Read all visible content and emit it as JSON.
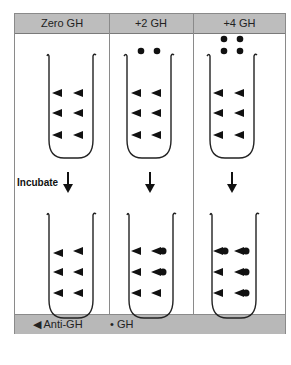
{
  "header": {
    "columns": [
      "Zero GH",
      "+2 GH",
      "+4 GH"
    ]
  },
  "step_label": "Incubate",
  "legend": {
    "items": [
      {
        "symbol": "triangle-left",
        "label": "Anti-GH"
      },
      {
        "symbol": "dot",
        "label": "GH"
      }
    ]
  },
  "tubes": {
    "before": [
      {
        "column": "Zero GH",
        "free_gh_dots": 0,
        "antibody_rows": 3,
        "antibodies_per_row": 2
      },
      {
        "column": "+2 GH",
        "free_gh_dots": 2,
        "antibody_rows": 3,
        "antibodies_per_row": 2
      },
      {
        "column": "+4 GH",
        "free_gh_dots": 4,
        "antibody_rows": 3,
        "antibodies_per_row": 2
      }
    ],
    "after": [
      {
        "column": "Zero GH",
        "bound_gh": 0
      },
      {
        "column": "+2 GH",
        "bound_gh": 2
      },
      {
        "column": "+4 GH",
        "bound_gh": 4
      }
    ]
  },
  "colors": {
    "header_bg": "#bdbdbd",
    "legend_bg": "#b8b8b8",
    "ink": "#111111",
    "border": "#8a8a8a"
  }
}
